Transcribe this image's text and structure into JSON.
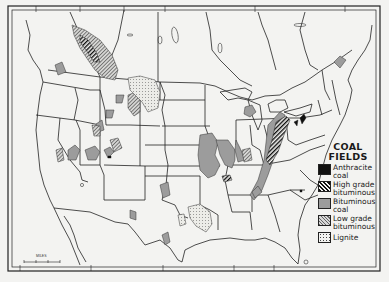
{
  "map": {
    "title": "Coal Fields",
    "region": "United States and southern Canada",
    "colors": {
      "background": "#f3f3f1",
      "line": "#222222",
      "anthracite": "#111111",
      "bituminous": "#9c9c9c",
      "low_grade_bituminous": "#c8c8c8",
      "lignite": "#e6e6e2"
    }
  },
  "legend": {
    "title_line1": "COAL",
    "title_line2": "FIELDS",
    "items": [
      {
        "key": "anthracite",
        "label_line1": "Anthracite",
        "label_line2": "coal"
      },
      {
        "key": "high-grade-bituminous",
        "label_line1": "High grade",
        "label_line2": "bituminous"
      },
      {
        "key": "bituminous",
        "label_line1": "Bituminous",
        "label_line2": "coal"
      },
      {
        "key": "low-grade-bituminous",
        "label_line1": "Low grade",
        "label_line2": "bituminous"
      },
      {
        "key": "lignite",
        "label_line1": "Lignite",
        "label_line2": ""
      }
    ]
  },
  "scale_bar": {
    "label": "MILES",
    "ticks": [
      "0",
      "200",
      "400",
      "600"
    ]
  }
}
